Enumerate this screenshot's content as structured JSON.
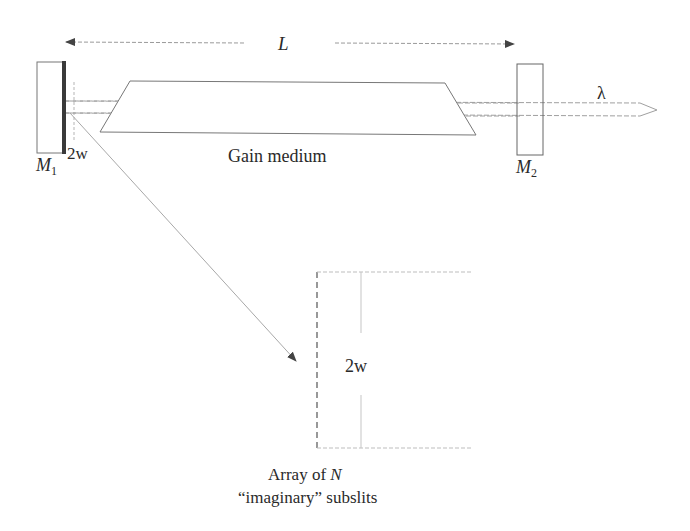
{
  "diagram": {
    "cavity_length_label": "L",
    "mirror1": {
      "symbol": "M",
      "subscript": "1"
    },
    "mirror2": {
      "symbol": "M",
      "subscript": "2"
    },
    "beam_width_label_mirror": "2w",
    "gain_medium_label": "Gain medium",
    "output_wavelength_label": "λ",
    "subslit_width_label": "2w",
    "subslit_caption_line1_prefix": "Array of ",
    "subslit_caption_line1_var": "N",
    "subslit_caption_line2": "“imaginary” subslits"
  },
  "colors": {
    "line": "#8a8a8a",
    "dark_line": "#555555",
    "reflector": "#3a3a3a",
    "text": "#2a2a2a"
  }
}
